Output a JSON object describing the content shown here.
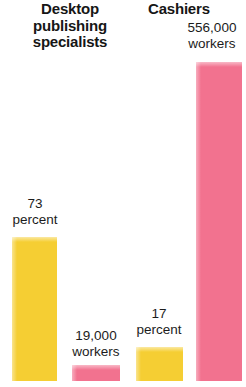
{
  "chart_data": {
    "type": "bar",
    "title": "",
    "subtitle": "",
    "xlabel": "",
    "ylabel": "",
    "grid": false,
    "legend": "none",
    "groups": [
      {
        "name": "Desktop publishing specialists",
        "label_lines": "Desktop\npublishing\nspecialists",
        "bars": [
          {
            "series": "percent",
            "value": 73,
            "unit": "percent",
            "label_lines": "73\npercent",
            "color": "#f5ce33"
          },
          {
            "series": "workers",
            "value": 19000,
            "unit": "workers",
            "label_lines": "19,000\nworkers",
            "color": "#f2728f"
          }
        ]
      },
      {
        "name": "Cashiers",
        "label_lines": "Cashiers",
        "bars": [
          {
            "series": "percent",
            "value": 17,
            "unit": "percent",
            "label_lines": "17\npercent",
            "color": "#f5ce33"
          },
          {
            "series": "workers",
            "value": 556000,
            "unit": "workers",
            "label_lines": "556,000\nworkers",
            "color": "#f2728f"
          }
        ]
      }
    ],
    "series": [
      {
        "name": "percent",
        "categories": [
          "Desktop publishing specialists",
          "Cashiers"
        ],
        "values": [
          73,
          17
        ],
        "color": "#f5ce33"
      },
      {
        "name": "workers",
        "categories": [
          "Desktop publishing specialists",
          "Cashiers"
        ],
        "values": [
          19000,
          556000
        ],
        "color": "#f2728f"
      }
    ],
    "colors": {
      "percent_bar": "#f5ce33",
      "workers_bar": "#f2728f",
      "text": "#1a1a1a",
      "background": "#ffffff"
    }
  },
  "titles": {
    "left": "Desktop\npublishing\nspecialists",
    "right": "Cashiers"
  },
  "labels": {
    "dtp_percent": "73\npercent",
    "dtp_workers": "19,000\nworkers",
    "cashiers_percent": "17\npercent",
    "cashiers_workers": "556,000\nworkers"
  }
}
